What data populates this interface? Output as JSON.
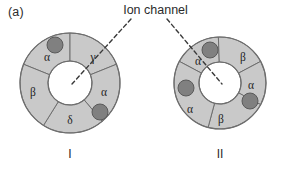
{
  "figure": {
    "panel_label": "(a)",
    "callout_label": "Ion channel",
    "background_color": "#ffffff"
  },
  "style": {
    "segment_fill": "#c9c9c9",
    "segment_stroke": "#6e6e6e",
    "pore_fill": "#ffffff",
    "binding_site_fill": "#808080",
    "binding_site_stroke": "#5a5a5a",
    "leader_line_color": "#3a3a3a",
    "text_color": "#2b2b2b"
  },
  "receptors": [
    {
      "id": "receptor-1",
      "roman_numeral": "I",
      "center_x": 70,
      "center_y": 83,
      "outer_radius": 50,
      "inner_radius": 22,
      "subunits": [
        {
          "label": "α",
          "start_angle": 202,
          "end_angle": 270,
          "label_x": 47,
          "label_y": 58,
          "has_binding_site": true,
          "site_x": 55,
          "site_y": 45,
          "site_r": 8
        },
        {
          "label": "γ",
          "start_angle": 270,
          "end_angle": 338,
          "label_x": 93,
          "label_y": 58,
          "has_binding_site": false,
          "site_x": 0,
          "site_y": 0,
          "site_r": 0
        },
        {
          "label": "α",
          "start_angle": 338,
          "end_angle": 50,
          "label_x": 104,
          "label_y": 93,
          "has_binding_site": true,
          "site_x": 100,
          "site_y": 112,
          "site_r": 8
        },
        {
          "label": "δ",
          "start_angle": 50,
          "end_angle": 122,
          "label_x": 70,
          "label_y": 121,
          "has_binding_site": false,
          "site_x": 0,
          "site_y": 0,
          "site_r": 0
        },
        {
          "label": "β",
          "start_angle": 122,
          "end_angle": 202,
          "label_x": 33,
          "label_y": 93,
          "has_binding_site": false,
          "site_x": 0,
          "site_y": 0,
          "site_r": 0
        }
      ],
      "leader_line": {
        "x1": 131,
        "y1": 19,
        "x2": 72,
        "y2": 84
      }
    },
    {
      "id": "receptor-2",
      "roman_numeral": "II",
      "center_x": 220,
      "center_y": 83,
      "outer_radius": 46,
      "inner_radius": 21,
      "subunits": [
        {
          "label": "α",
          "start_angle": 208,
          "end_angle": 268,
          "label_x": 198,
          "label_y": 62,
          "has_binding_site": true,
          "site_x": 210,
          "site_y": 50,
          "site_r": 8
        },
        {
          "label": "β",
          "start_angle": 268,
          "end_angle": 332,
          "label_x": 243,
          "label_y": 58,
          "has_binding_site": false,
          "site_x": 0,
          "site_y": 0,
          "site_r": 0
        },
        {
          "label": "α",
          "start_angle": 332,
          "end_angle": 28,
          "label_x": 251,
          "label_y": 86,
          "has_binding_site": true,
          "site_x": 250,
          "site_y": 101,
          "site_r": 8
        },
        {
          "label": "β",
          "start_angle": 28,
          "end_angle": 105,
          "label_x": 221,
          "label_y": 120,
          "has_binding_site": false,
          "site_x": 0,
          "site_y": 0,
          "site_r": 0
        },
        {
          "label": "α",
          "start_angle": 105,
          "end_angle": 208,
          "label_x": 190,
          "label_y": 110,
          "has_binding_site": true,
          "site_x": 186,
          "site_y": 88,
          "site_r": 8
        }
      ],
      "leader_line": {
        "x1": 167,
        "y1": 19,
        "x2": 222,
        "y2": 84
      }
    }
  ]
}
